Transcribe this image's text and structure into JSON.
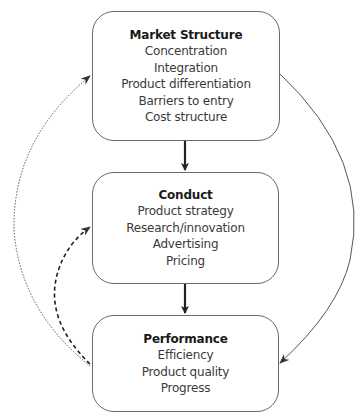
{
  "diagram": {
    "nodes": [
      {
        "id": "structure",
        "title": "Market Structure",
        "items": [
          "Concentration",
          "Integration",
          "Product differentiation",
          "Barriers to entry",
          "Cost structure"
        ]
      },
      {
        "id": "conduct",
        "title": "Conduct",
        "items": [
          "Product strategy",
          "Research/innovation",
          "Advertising",
          "Pricing"
        ]
      },
      {
        "id": "performance",
        "title": "Performance",
        "items": [
          "Efficiency",
          "Product quality",
          "Progress"
        ]
      }
    ],
    "edges": [
      {
        "from": "Market Structure",
        "to": "Conduct",
        "style": "solid-thick"
      },
      {
        "from": "Conduct",
        "to": "Performance",
        "style": "solid-thick"
      },
      {
        "from": "Market Structure",
        "to": "Performance",
        "style": "solid-thin-curved"
      },
      {
        "from": "Performance",
        "to": "Conduct",
        "style": "dashed-curved"
      },
      {
        "from": "Performance",
        "to": "Market Structure",
        "style": "dotted-curved"
      }
    ]
  },
  "colors": {
    "border": "#6a6a6a",
    "arrow": "#2a2a2a",
    "text": "#2a2a2a"
  }
}
